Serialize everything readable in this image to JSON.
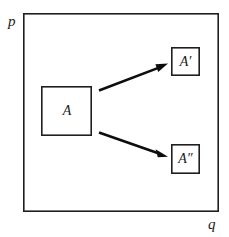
{
  "figure": {
    "caption_present": false,
    "axes": {
      "vertical_label": "p",
      "horizontal_label": "q"
    },
    "frame": {
      "name": "phase-space-boundary",
      "x": 23,
      "y": 13,
      "width": 196,
      "height": 199
    },
    "regions": [
      {
        "id": "initial",
        "label": "A",
        "x": 41,
        "y": 86,
        "width": 51,
        "height": 50
      },
      {
        "id": "evolved-primed",
        "label": "A′",
        "x": 171,
        "y": 47,
        "width": 29,
        "height": 29
      },
      {
        "id": "evolved-double-primed",
        "label": "A″",
        "x": 171,
        "y": 144,
        "width": 29,
        "height": 30
      }
    ],
    "arrows": [
      {
        "id": "arrow-to-a-prime",
        "from_x": 99,
        "from_y": 90,
        "to_x": 168,
        "to_y": 64
      },
      {
        "id": "arrow-to-a-double-prime",
        "from_x": 99,
        "from_y": 132,
        "to_x": 168,
        "to_y": 157
      }
    ],
    "colors": {
      "ink": "#1f1f1f",
      "arrow": "#0d0d0d",
      "background": "#ffffff"
    }
  }
}
